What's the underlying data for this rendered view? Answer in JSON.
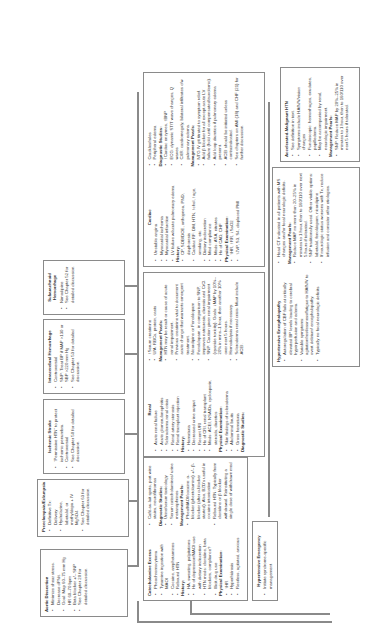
{
  "root": {
    "title": "Hypertensive Emergency",
    "items": [
      "Initiate syndrome-specific management"
    ]
  },
  "top_boxes": [
    {
      "title": "Aortic Dissection",
      "items": [
        "Minimize shear stress. Decrease dP/dt.",
        "Goal: Map 60–75 mm Hg HR 60–70 bpm",
        "Beta blocker +/– SNP",
        "See Chapter 20 for detailed discussion."
      ]
    },
    {
      "title": "Preeclampsia/Eclampsia",
      "items": [
        "Definitive Tx: Delivery",
        "Hydralazine, labetalol, or methyldopa + IV MgSO4",
        "See Chapter 63 for detailed discussion."
      ]
    },
    {
      "title": "Ischemic Stroke",
      "items": [
        "“Permissive HTN” to protect ischemic penumbra.",
        "Controversial",
        "See Chapter 50 for detailed discussion."
      ]
    },
    {
      "title": "Intracerebral Hemorrhage",
      "items": [
        "Controversial",
        "SNP: Treat BP if MAP >130 or SBP >220 mm Hg",
        "See Chapter 53 for detailed discussion."
      ]
    },
    {
      "title": "Subarachnoid Hemorrhage",
      "items": [
        "Nimodipine",
        "See Chapter 52 for detailed discussion."
      ]
    }
  ],
  "catecholamine": {
    "title": "Catecholamine Excess",
    "items": [
      "Pheochromocytoma",
      "Tyramine ingestion with MAOI",
      "Cocaine, amphetamines",
      "Rebound HTN"
    ],
    "history_label": "History:",
    "history": [
      "HA, sweating, palpitations",
      "Hx of depression/MAOI use with dietary indiscretion",
      "HTN meds: clonidine, beta blockers, compliance?",
      "Illicit drug use"
    ],
    "exam_label": "Physical Examination:",
    "exam": [
      "↑HR",
      "Hyperhidrosis",
      "Restless, agitated, anxious",
      "Café-au-lait spots, port wine stains, neurofibromas"
    ],
    "dx_label": "Diagnostic Studies:",
    "dx": [
      "Urine/serum toxicology",
      "Serum catecholamines/ urine metanephrines"
    ],
    "mgmt_label": "Management Pearls:",
    "mgmt": [
      "Pheo/MAOI/cocaine: α-blocker (phentolamine) +/– β-blocker (after α-blocker started). Also, BZD’s useful in cocaine intoxication.",
      "Rebound HTN: Typically from clonidine or β blocker withdrawal. Reinstituting a single dose of withdrawn med usually sufficient to abate crisis.",
      "If above strategies yield little response, alternative therapies can be used (i.e., SNP, labetalol)."
    ]
  },
  "renal": {
    "title": "Renal",
    "items": [
      "Acute renal failure",
      "Acute glomerulonephritis",
      "Scleroderma renal crisis",
      "Renal artery stenosis",
      "Renal transplant rejection"
    ],
    "history_label": "History:",
    "history": [
      "Hematuria",
      "Decreased urine output",
      "Recent URI",
      "Hx of CRI, renal transplant",
      "Meds: ACEI, NSAIDs, cyclosporin, steroids, diuretics"
    ],
    "exam_label": "Physical Examination:",
    "exam": [
      "Skin findings of scleroderma",
      "Abdominal bruits",
      "Gross hematuria"
    ],
    "dx_label": "Diagnostic Studies:",
    "dx": [
      "↑Serum creatinine",
      "U/A: RBCs, protein, casts"
    ],
    "mgmt_label": "Management Pearls:",
    "mgmt": [
      "HTN may be result or cause of acute renal impairment.",
      "Previous creatinine vital to document acute change that warrants emergent treatment.",
      "Nicardipine or Fenoldopam",
      "Fenoldopam, in comparison to SNP, improves natriuresis, diuresis and CrCl.",
      "SNP: Caution given renal impairment (cyanide toxicity). Goals: ↓MAP by 10%–20% in mins–1 hour, then another 10% over next 5 hours.",
      "Hemodialysis if necessary.",
      "Scleroderma renal crisis: Must include ACEI."
    ]
  },
  "cardiac": {
    "title": "Cardiac",
    "items": [
      "Unstable angina",
      "Myocardial ischemia",
      "Myocardial infarction",
      "LV failure w/acute pulmonary edema"
    ],
    "history_label": "History:",
    "history": [
      "CP, SOB/DOE, orthopnea, PND, diaphoresis",
      "Cardiac RF: DM, HTN, ↑chol, ↑age, smoking, etc.",
      "Dietary indiscretion",
      "Med compliance",
      "Meds: ASA, nitrates",
      "Hx of CAD, CHF"
    ],
    "exam_label": "Physical Examination:",
    "exam": [
      "↑HR, ↑RR, ↓SaO2",
      "↑JVP, S3, S4, displaced PMI",
      "Crackles/rales",
      "Peripheral edema"
    ],
    "dx_label": "Diagnostic Studies:",
    "dx": [
      "↑Cardiac enzymes, ↑BNP",
      "ECG: dynamic ST/T wave changes, Q waves",
      "CXR: cardiomegaly, bilateral infiltrates c/w pulmonary edema."
    ],
    "mgmt_label": "Management Pearls:",
    "mgmt": [
      "NTG IV gtt titrated to symptom relief.",
      "Add β blocker for all except acute LV failure (hold until compensated/euvolemic).",
      "Add loop diuretics if pulmonary edema present.",
      "ACEI should be initiated unless contraindicated.",
      "See chapters on AMI (18) and CHF (21) for further discussion."
    ]
  },
  "encephalopathy": {
    "title": "Hypertensive Encephalopathy",
    "items": [
      "Autoregulation of CBF fails at critically elevated BP levels leading to cerebral hyperperfusion and edema.",
      "Variable symptoms: agitation/restlessness/fatigue to HA/N/V to overt delirium/ encephalopathy.",
      "Typically no focal neurologic deficits.",
      "Head CT indicated in all patients with MS changes and/or focal neurologic deficits."
    ],
    "mgmt_label": "Management Pearls:",
    "mgmt": [
      "Reduce MAP no more than 20–25% in minutes to 1 hour, then to 160/110 over next 5 hours if tolerated.",
      "SNP traditionally used. Other viable options: labetalol, fenoldopam, nicardipine",
      "If neurologic status worsens with Tx, reduce infusion and consider other etiologies."
    ]
  },
  "accelerated": {
    "title": "Accelerated-Malignant HTN",
    "items": [
      "See definition in text.",
      "Symptoms include HA/N/V/vision changes",
      "Fundoscopic: hemorrhages, exudates, papilledema.",
      "May be accompanied by renal, neurologic impairment."
    ],
    "mgmt_label": "Management Pearls:",
    "mgmt": [
      "SNP: Reduce MAP by 20%–25% in minutes to 1 hour, then to 160/110 over next 5 hours if tolerated."
    ]
  },
  "colors": {
    "border": "#8a8a8a",
    "text": "#3a3a3a"
  }
}
